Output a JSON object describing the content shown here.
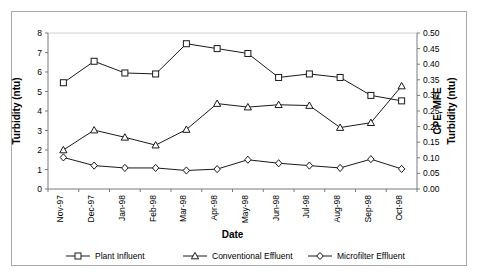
{
  "chart_data": {
    "type": "line",
    "title": "",
    "xlabel": "Date",
    "ylabel": "Turbidity (ntu)",
    "ylabel_right_line1": "CPE, MFE",
    "ylabel_right_line2": "Turbidity (ntu)",
    "categories": [
      "Nov-97",
      "Dec-97",
      "Jan-98",
      "Feb-98",
      "Mar-98",
      "Apr-98",
      "May-98",
      "Jun-98",
      "Jul-98",
      "Aug-98",
      "Sep-98",
      "Oct-98"
    ],
    "ylim": [
      0,
      8
    ],
    "yticks": [
      "0",
      "1",
      "2",
      "3",
      "4",
      "5",
      "6",
      "7",
      "8"
    ],
    "ylim_right": [
      0.0,
      0.5
    ],
    "yticks_right": [
      "0.00",
      "0.05",
      "0.10",
      "0.15",
      "0.20",
      "0.25",
      "0.30",
      "0.35",
      "0.40",
      "0.45",
      "0.50"
    ],
    "grid": false,
    "legend_position": "bottom",
    "series": [
      {
        "name": "Plant Influent",
        "marker": "square",
        "axis": "left",
        "values": [
          5.45,
          6.55,
          5.95,
          5.9,
          7.45,
          7.2,
          6.95,
          5.72,
          5.9,
          5.72,
          4.8,
          4.52
        ]
      },
      {
        "name": "Conventional Effluent",
        "marker": "triangle",
        "axis": "left",
        "values": [
          2.0,
          3.02,
          2.65,
          2.25,
          3.05,
          4.38,
          4.2,
          4.32,
          4.28,
          3.15,
          3.4,
          5.28
        ]
      },
      {
        "name": "Microfilter Effluent",
        "marker": "diamond",
        "axis": "left",
        "values": [
          1.62,
          1.2,
          1.08,
          1.08,
          0.95,
          1.02,
          1.5,
          1.32,
          1.2,
          1.08,
          1.53,
          1.03
        ]
      }
    ]
  },
  "colors": {
    "line": "#1a1a1a",
    "marker_fill": "#ffffff",
    "axis": "#7a7a7a",
    "border": "#a8a8a8"
  }
}
